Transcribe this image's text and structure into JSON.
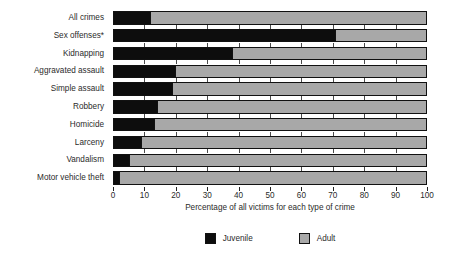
{
  "chart_data": {
    "type": "bar",
    "orientation": "horizontal",
    "stacked": true,
    "stacked_percent": true,
    "title": "",
    "xlabel": "Percentage of all victims for each type of crime",
    "ylabel": "",
    "xlim": [
      0,
      100
    ],
    "xticks": [
      0,
      10,
      20,
      30,
      40,
      50,
      60,
      70,
      80,
      90,
      100
    ],
    "xtick_labels": [
      "0",
      "10",
      "20",
      "30",
      "40",
      "50",
      "60",
      "70",
      "80",
      "90",
      "100"
    ],
    "grid": false,
    "legend_position": "bottom-center",
    "categories": [
      "All crimes",
      "Sex offenses*",
      "Kidnapping",
      "Aggravated assault",
      "Simple assault",
      "Robbery",
      "Homicide",
      "Larceny",
      "Vandalism",
      "Motor vehicle theft"
    ],
    "series": [
      {
        "name": "Juvenile",
        "color": "#0d0d0d",
        "values": [
          12,
          71,
          38,
          20,
          19,
          14,
          13,
          9,
          5,
          2
        ]
      },
      {
        "name": "Adult",
        "color": "#a8a8a8",
        "values": [
          88,
          29,
          62,
          80,
          81,
          86,
          87,
          91,
          95,
          98
        ]
      }
    ],
    "annotations": [
      "*"
    ]
  },
  "legend": {
    "items": [
      {
        "label": "Juvenile",
        "color": "#0d0d0d"
      },
      {
        "label": "Adult",
        "color": "#a8a8a8"
      }
    ]
  }
}
